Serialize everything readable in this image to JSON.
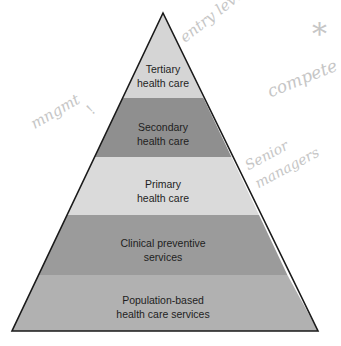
{
  "diagram": {
    "type": "pyramid",
    "layers": [
      {
        "line1": "Tertiary",
        "line2": "health care",
        "color": "#d5d5d5"
      },
      {
        "line1": "Secondary",
        "line2": "health care",
        "color": "#8f8f8f"
      },
      {
        "line1": "Primary",
        "line2": "health care",
        "color": "#dadada"
      },
      {
        "line1": "Clinical preventive",
        "line2": "services",
        "color": "#9b9b9b"
      },
      {
        "line1": "Population-based",
        "line2": "health care services",
        "color": "#b1b1b1"
      }
    ],
    "outline_color": "#1a1a1a"
  },
  "annotations": {
    "entry_level": "entry level",
    "star": "*",
    "compete": "compete",
    "mgmt": "mngmt",
    "mgmt_mark": "!",
    "senior": "Senior",
    "managers": "managers",
    "color": "#c6c6c6"
  }
}
